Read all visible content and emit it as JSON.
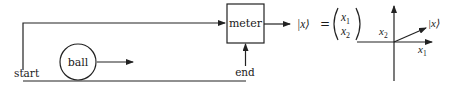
{
  "labels": {
    "start": "start",
    "ball": "ball",
    "meter": "meter",
    "end": "end"
  },
  "equation": {
    "ket": "|x⟩",
    "equals": "=",
    "component1": "x",
    "component1_sub": "1",
    "component2": "x",
    "component2_sub": "2"
  },
  "axes": {
    "x_axis_label": "x",
    "x_axis_sub": "1",
    "y_axis_label": "x",
    "y_axis_sub": "2",
    "vector_label": "|x⟩"
  },
  "colors": {
    "stroke": "#222222",
    "background": "#ffffff"
  }
}
